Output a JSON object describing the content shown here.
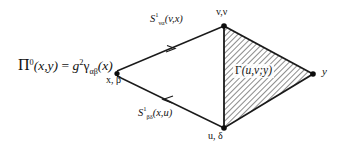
{
  "canvas": {
    "width": 346,
    "height": 151,
    "background": "#ffffff",
    "line_color": "#1a1a1a",
    "hatch_color": "#2b2b2b"
  },
  "formula": {
    "pi_symbol": "Π",
    "pi_superscript": "0",
    "pi_args": "(x,y)",
    "equals": " = ",
    "coupling": "g",
    "coupling_exponent": "2",
    "gamma_symbol": "γ",
    "gamma_subscript": "αβ",
    "gamma_args": "(x)",
    "full_text": "Π⁰(x,y) = g²γαβ(x)"
  },
  "propagators": {
    "top": {
      "symbol": "S",
      "superscript": "1",
      "subscript": "να",
      "args": "(v,x)",
      "full_text": "S¹να(v,x)",
      "arrow_direction": "toward-v"
    },
    "bottom": {
      "symbol": "S",
      "superscript": "1",
      "subscript": "βδ",
      "args": "(x,u)",
      "full_text": "S¹βδ(x,u)",
      "arrow_direction": "toward-x"
    }
  },
  "vertices": {
    "left": "x, β",
    "top_right": "v,ν",
    "bottom_right": "u, δ",
    "right": "y"
  },
  "blob": {
    "label_symbol": "Γ",
    "label_args": "(u,v;y)",
    "full_text": "Γ (u,v;y)",
    "fill_pattern": "diagonal-hatch"
  }
}
